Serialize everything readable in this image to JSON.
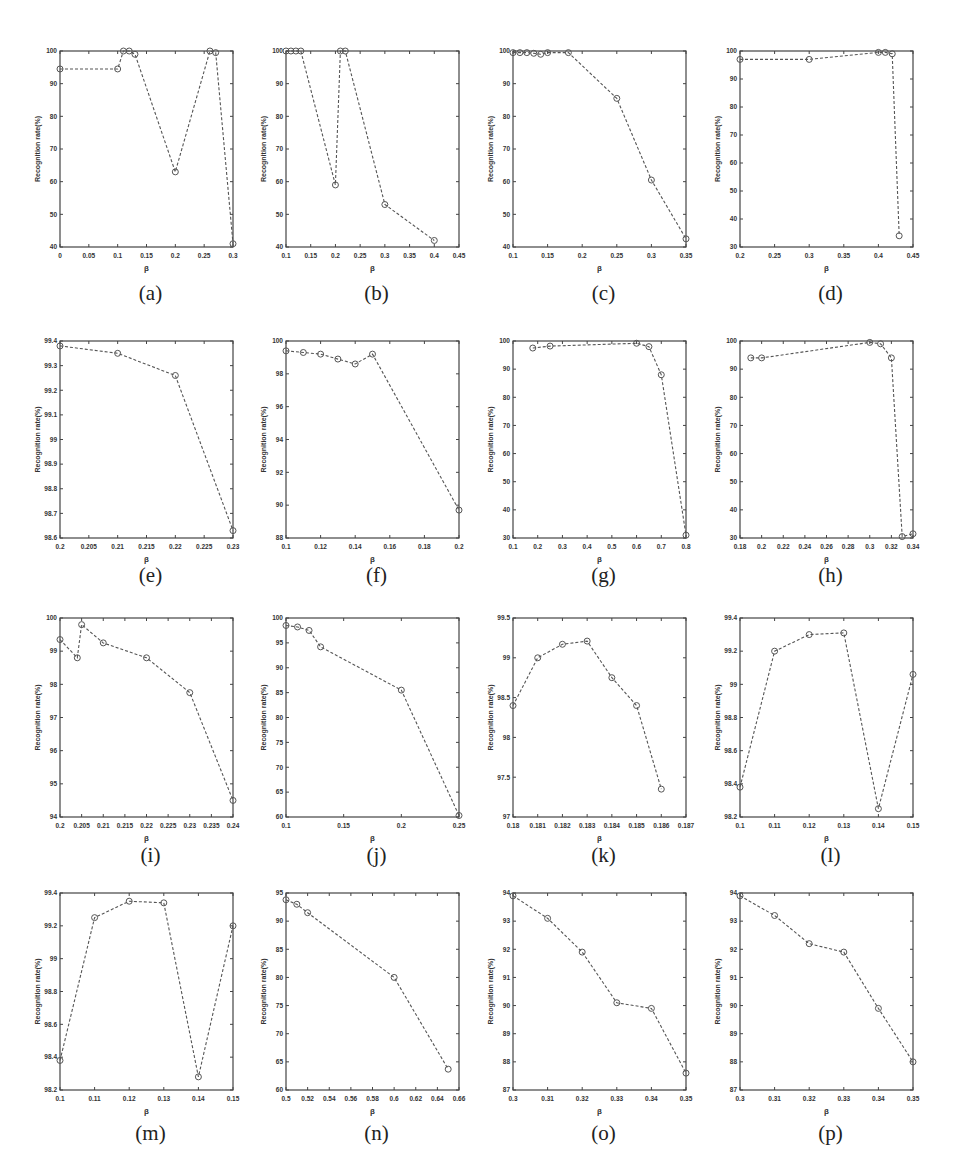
{
  "figure": {
    "line_color": "#555555",
    "axis_color": "#444444",
    "text_color": "#333333",
    "marker": "circle-open",
    "line_style": "dashed"
  },
  "chart_data": [
    {
      "panel": "(a)",
      "type": "line",
      "title": "",
      "xlabel": "β",
      "ylabel": "Recognition rate(%)",
      "xlim": [
        0,
        0.3
      ],
      "ylim": [
        40,
        100
      ],
      "xticks": [
        0,
        0.05,
        0.1,
        0.15,
        0.2,
        0.25,
        0.3
      ],
      "xtick_labels": [
        "0",
        "0.05",
        "0.1",
        "0.15",
        "0.2",
        "0.25",
        "0.3"
      ],
      "yticks": [
        40,
        50,
        60,
        70,
        80,
        90,
        100
      ],
      "ytick_labels": [
        "40",
        "50",
        "60",
        "70",
        "80",
        "90",
        "100"
      ],
      "x": [
        0,
        0.1,
        0.11,
        0.12,
        0.13,
        0.2,
        0.26,
        0.27,
        0.3
      ],
      "y": [
        94.5,
        94.5,
        100,
        100,
        99,
        63,
        100,
        99.5,
        41
      ]
    },
    {
      "panel": "(b)",
      "type": "line",
      "title": "",
      "xlabel": "β",
      "ylabel": "Recognition rate(%)",
      "xlim": [
        0.1,
        0.45
      ],
      "ylim": [
        40,
        100
      ],
      "xticks": [
        0.1,
        0.15,
        0.2,
        0.25,
        0.3,
        0.35,
        0.4,
        0.45
      ],
      "xtick_labels": [
        "0.1",
        "0.15",
        "0.2",
        "0.25",
        "0.3",
        "0.35",
        "0.4",
        "0.45"
      ],
      "yticks": [
        40,
        50,
        60,
        70,
        80,
        90,
        100
      ],
      "ytick_labels": [
        "40",
        "50",
        "60",
        "70",
        "80",
        "90",
        "100"
      ],
      "x": [
        0.1,
        0.11,
        0.12,
        0.13,
        0.2,
        0.21,
        0.22,
        0.3,
        0.4
      ],
      "y": [
        100,
        100,
        100,
        100,
        59,
        100,
        100,
        53,
        42
      ]
    },
    {
      "panel": "(c)",
      "type": "line",
      "title": "",
      "xlabel": "β",
      "ylabel": "Recognition rate(%)",
      "xlim": [
        0.1,
        0.35
      ],
      "ylim": [
        40,
        100
      ],
      "xticks": [
        0.1,
        0.15,
        0.2,
        0.25,
        0.3,
        0.35
      ],
      "xtick_labels": [
        "0.1",
        "0.15",
        "0.2",
        "0.25",
        "0.3",
        "0.35"
      ],
      "yticks": [
        40,
        50,
        60,
        70,
        80,
        90,
        100
      ],
      "ytick_labels": [
        "40",
        "50",
        "60",
        "70",
        "80",
        "90",
        "100"
      ],
      "x": [
        0.1,
        0.11,
        0.12,
        0.13,
        0.14,
        0.15,
        0.18,
        0.25,
        0.3,
        0.35
      ],
      "y": [
        99.5,
        99.5,
        99.5,
        99.3,
        99,
        99.5,
        99.5,
        85.5,
        60.5,
        42.5
      ]
    },
    {
      "panel": "(d)",
      "type": "line",
      "title": "",
      "xlabel": "β",
      "ylabel": "Recognition rate(%)",
      "xlim": [
        0.2,
        0.45
      ],
      "ylim": [
        30,
        100
      ],
      "xticks": [
        0.2,
        0.25,
        0.3,
        0.35,
        0.4,
        0.45
      ],
      "xtick_labels": [
        "0.2",
        "0.25",
        "0.3",
        "0.35",
        "0.4",
        "0.45"
      ],
      "yticks": [
        30,
        40,
        50,
        60,
        70,
        80,
        90,
        100
      ],
      "ytick_labels": [
        "30",
        "40",
        "50",
        "60",
        "70",
        "80",
        "90",
        "100"
      ],
      "x": [
        0.2,
        0.3,
        0.4,
        0.41,
        0.42,
        0.43
      ],
      "y": [
        97,
        97,
        99.5,
        99.5,
        99,
        34
      ]
    },
    {
      "panel": "(e)",
      "type": "line",
      "title": "",
      "xlabel": "β",
      "ylabel": "Recognition rate(%)",
      "xlim": [
        0.2,
        0.23
      ],
      "ylim": [
        98.6,
        99.4
      ],
      "xticks": [
        0.2,
        0.205,
        0.21,
        0.215,
        0.22,
        0.225,
        0.23
      ],
      "xtick_labels": [
        "0.2",
        "0.205",
        "0.21",
        "0.215",
        "0.22",
        "0.225",
        "0.23"
      ],
      "yticks": [
        98.6,
        98.7,
        98.8,
        98.9,
        99,
        99.1,
        99.2,
        99.3,
        99.4
      ],
      "ytick_labels": [
        "98.6",
        "98.7",
        "98.8",
        "98.9",
        "99",
        "99.1",
        "99.2",
        "99.3",
        "99.4"
      ],
      "x": [
        0.2,
        0.21,
        0.22,
        0.23
      ],
      "y": [
        99.38,
        99.35,
        99.26,
        98.63
      ]
    },
    {
      "panel": "(f)",
      "type": "line",
      "title": "",
      "xlabel": "β",
      "ylabel": "Recognition rate(%)",
      "xlim": [
        0.1,
        0.2
      ],
      "ylim": [
        88,
        100
      ],
      "xticks": [
        0.1,
        0.12,
        0.14,
        0.16,
        0.18,
        0.2
      ],
      "xtick_labels": [
        "0.1",
        "0.12",
        "0.14",
        "0.16",
        "0.18",
        "0.2"
      ],
      "yticks": [
        88,
        90,
        92,
        94,
        96,
        98,
        100
      ],
      "ytick_labels": [
        "88",
        "90",
        "92",
        "94",
        "96",
        "98",
        "100"
      ],
      "x": [
        0.1,
        0.11,
        0.12,
        0.13,
        0.14,
        0.15,
        0.2
      ],
      "y": [
        99.4,
        99.3,
        99.2,
        98.9,
        98.6,
        99.2,
        89.7
      ]
    },
    {
      "panel": "(g)",
      "type": "line",
      "title": "",
      "xlabel": "β",
      "ylabel": "Recognition rate(%)",
      "xlim": [
        0.1,
        0.8
      ],
      "ylim": [
        30,
        100
      ],
      "xticks": [
        0.1,
        0.2,
        0.3,
        0.4,
        0.5,
        0.6,
        0.7,
        0.8
      ],
      "xtick_labels": [
        "0.1",
        "0.2",
        "0.3",
        "0.4",
        "0.5",
        "0.6",
        "0.7",
        "0.8"
      ],
      "yticks": [
        30,
        40,
        50,
        60,
        70,
        80,
        90,
        100
      ],
      "ytick_labels": [
        "30",
        "40",
        "50",
        "60",
        "70",
        "80",
        "90",
        "100"
      ],
      "x": [
        0.18,
        0.25,
        0.6,
        0.65,
        0.7,
        0.8
      ],
      "y": [
        97.5,
        98.2,
        99.2,
        98,
        88,
        31
      ]
    },
    {
      "panel": "(h)",
      "type": "line",
      "title": "",
      "xlabel": "β",
      "ylabel": "Recognition rate(%)",
      "xlim": [
        0.18,
        0.34
      ],
      "ylim": [
        30,
        100
      ],
      "xticks": [
        0.18,
        0.2,
        0.22,
        0.24,
        0.26,
        0.28,
        0.3,
        0.32,
        0.34
      ],
      "xtick_labels": [
        "0.18",
        "0.2",
        "0.22",
        "0.24",
        "0.26",
        "0.28",
        "0.3",
        "0.32",
        "0.34"
      ],
      "yticks": [
        30,
        40,
        50,
        60,
        70,
        80,
        90,
        100
      ],
      "ytick_labels": [
        "30",
        "40",
        "50",
        "60",
        "70",
        "80",
        "90",
        "100"
      ],
      "x": [
        0.19,
        0.2,
        0.3,
        0.31,
        0.32,
        0.33,
        0.34
      ],
      "y": [
        94,
        94,
        99.5,
        99,
        94,
        30.5,
        31.5
      ]
    },
    {
      "panel": "(i)",
      "type": "line",
      "title": "",
      "xlabel": "β",
      "ylabel": "Recognition rate(%)",
      "xlim": [
        0.2,
        0.24
      ],
      "ylim": [
        94,
        100
      ],
      "xticks": [
        0.2,
        0.205,
        0.21,
        0.215,
        0.22,
        0.225,
        0.23,
        0.235,
        0.24
      ],
      "xtick_labels": [
        "0.2",
        "0.205",
        "0.21",
        "0.215",
        "0.22",
        "0.225",
        "0.23",
        "0.235",
        "0.24"
      ],
      "yticks": [
        94,
        95,
        96,
        97,
        98,
        99,
        100
      ],
      "ytick_labels": [
        "94",
        "95",
        "96",
        "97",
        "98",
        "99",
        "100"
      ],
      "x": [
        0.2,
        0.204,
        0.205,
        0.21,
        0.22,
        0.23,
        0.24
      ],
      "y": [
        99.35,
        98.8,
        99.8,
        99.25,
        98.8,
        97.75,
        94.5
      ]
    },
    {
      "panel": "(j)",
      "type": "line",
      "title": "",
      "xlabel": "β",
      "ylabel": "Recognition rate(%)",
      "xlim": [
        0.1,
        0.25
      ],
      "ylim": [
        60,
        100
      ],
      "xticks": [
        0.1,
        0.15,
        0.2,
        0.25
      ],
      "xtick_labels": [
        "0.1",
        "0.15",
        "0.2",
        "0.25"
      ],
      "yticks": [
        60,
        65,
        70,
        75,
        80,
        85,
        90,
        95,
        100
      ],
      "ytick_labels": [
        "60",
        "65",
        "70",
        "75",
        "80",
        "85",
        "90",
        "95",
        "100"
      ],
      "x": [
        0.1,
        0.11,
        0.12,
        0.13,
        0.2,
        0.25
      ],
      "y": [
        98.5,
        98.2,
        97.5,
        94.2,
        85.5,
        60.3
      ]
    },
    {
      "panel": "(k)",
      "type": "line",
      "title": "",
      "xlabel": "β",
      "ylabel": "Recognition rate(%)",
      "xlim": [
        0.18,
        0.187
      ],
      "ylim": [
        97,
        99.5
      ],
      "xticks": [
        0.18,
        0.181,
        0.182,
        0.183,
        0.184,
        0.185,
        0.186,
        0.187
      ],
      "xtick_labels": [
        "0.18",
        "0.181",
        "0.182",
        "0.183",
        "0.184",
        "0.185",
        "0.186",
        "0.187"
      ],
      "yticks": [
        97,
        97.5,
        98,
        98.5,
        99,
        99.5
      ],
      "ytick_labels": [
        "97",
        "97.5",
        "98",
        "98.5",
        "99",
        "99.5"
      ],
      "x": [
        0.18,
        0.181,
        0.182,
        0.183,
        0.184,
        0.185,
        0.186
      ],
      "y": [
        98.4,
        99,
        99.17,
        99.21,
        98.75,
        98.4,
        97.35
      ]
    },
    {
      "panel": "(l)",
      "type": "line",
      "title": "",
      "xlabel": "β",
      "ylabel": "Recognition rate(%)",
      "xlim": [
        0.1,
        0.15
      ],
      "ylim": [
        98.2,
        99.4
      ],
      "xticks": [
        0.1,
        0.11,
        0.12,
        0.13,
        0.14,
        0.15
      ],
      "xtick_labels": [
        "0.1",
        "0.11",
        "0.12",
        "0.13",
        "0.14",
        "0.15"
      ],
      "yticks": [
        98.2,
        98.4,
        98.6,
        98.8,
        99,
        99.2,
        99.4
      ],
      "ytick_labels": [
        "98.2",
        "98.4",
        "98.6",
        "98.8",
        "99",
        "99.2",
        "99.4"
      ],
      "x": [
        0.1,
        0.11,
        0.12,
        0.13,
        0.14,
        0.15
      ],
      "y": [
        98.38,
        99.2,
        99.3,
        99.31,
        98.25,
        99.06
      ]
    },
    {
      "panel": "(m)",
      "type": "line",
      "title": "",
      "xlabel": "β",
      "ylabel": "Recognition rate(%)",
      "xlim": [
        0.1,
        0.15
      ],
      "ylim": [
        98.2,
        99.4
      ],
      "xticks": [
        0.1,
        0.11,
        0.12,
        0.13,
        0.14,
        0.15
      ],
      "xtick_labels": [
        "0.1",
        "0.11",
        "0.12",
        "0.13",
        "0.14",
        "0.15"
      ],
      "yticks": [
        98.2,
        98.4,
        98.6,
        98.8,
        99,
        99.2,
        99.4
      ],
      "ytick_labels": [
        "98.2",
        "98.4",
        "98.6",
        "98.8",
        "99",
        "99.2",
        "99.4"
      ],
      "x": [
        0.1,
        0.11,
        0.12,
        0.13,
        0.14,
        0.15
      ],
      "y": [
        98.38,
        99.25,
        99.35,
        99.34,
        98.28,
        99.2
      ]
    },
    {
      "panel": "(n)",
      "type": "line",
      "title": "",
      "xlabel": "β",
      "ylabel": "Recognition rate(%)",
      "xlim": [
        0.5,
        0.66
      ],
      "ylim": [
        60,
        95
      ],
      "xticks": [
        0.5,
        0.52,
        0.54,
        0.56,
        0.58,
        0.6,
        0.62,
        0.64,
        0.66
      ],
      "xtick_labels": [
        "0.5",
        "0.52",
        "0.54",
        "0.56",
        "0.58",
        "0.6",
        "0.62",
        "0.64",
        "0.66"
      ],
      "yticks": [
        60,
        65,
        70,
        75,
        80,
        85,
        90,
        95
      ],
      "ytick_labels": [
        "60",
        "65",
        "70",
        "75",
        "80",
        "85",
        "90",
        "95"
      ],
      "x": [
        0.5,
        0.51,
        0.52,
        0.6,
        0.65
      ],
      "y": [
        93.8,
        93,
        91.5,
        80,
        63.7
      ]
    },
    {
      "panel": "(o)",
      "type": "line",
      "title": "",
      "xlabel": "β",
      "ylabel": "Recognition rate(%)",
      "xlim": [
        0.3,
        0.35
      ],
      "ylim": [
        87,
        94
      ],
      "xticks": [
        0.3,
        0.31,
        0.32,
        0.33,
        0.34,
        0.35
      ],
      "xtick_labels": [
        "0.3",
        "0.31",
        "0.32",
        "0.33",
        "0.34",
        "0.35"
      ],
      "yticks": [
        87,
        88,
        89,
        90,
        91,
        92,
        93,
        94
      ],
      "ytick_labels": [
        "87",
        "88",
        "89",
        "90",
        "91",
        "92",
        "93",
        "94"
      ],
      "x": [
        0.3,
        0.31,
        0.32,
        0.33,
        0.34,
        0.35
      ],
      "y": [
        93.9,
        93.1,
        91.9,
        90.1,
        89.9,
        87.6
      ]
    },
    {
      "panel": "(p)",
      "type": "line",
      "title": "",
      "xlabel": "β",
      "ylabel": "Recognition rate(%)",
      "xlim": [
        0.3,
        0.35
      ],
      "ylim": [
        87,
        94
      ],
      "xticks": [
        0.3,
        0.31,
        0.32,
        0.33,
        0.34,
        0.35
      ],
      "xtick_labels": [
        "0.3",
        "0.31",
        "0.32",
        "0.33",
        "0.34",
        "0.35"
      ],
      "yticks": [
        87,
        88,
        89,
        90,
        91,
        92,
        93,
        94
      ],
      "ytick_labels": [
        "87",
        "88",
        "89",
        "90",
        "91",
        "92",
        "93",
        "94"
      ],
      "x": [
        0.3,
        0.31,
        0.32,
        0.33,
        0.34,
        0.35
      ],
      "y": [
        93.9,
        93.2,
        92.2,
        91.9,
        89.9,
        88
      ]
    }
  ],
  "layout": {
    "columns_left": [
      60,
      286,
      513,
      740
    ],
    "plot_width": 173,
    "rows": [
      {
        "top": 51,
        "bottom": 247,
        "label_y": 280
      },
      {
        "top": 341,
        "bottom": 538,
        "label_y": 562
      },
      {
        "top": 618,
        "bottom": 817,
        "label_y": 842
      },
      {
        "top": 893,
        "bottom": 1090,
        "label_y": 1120
      }
    ]
  }
}
